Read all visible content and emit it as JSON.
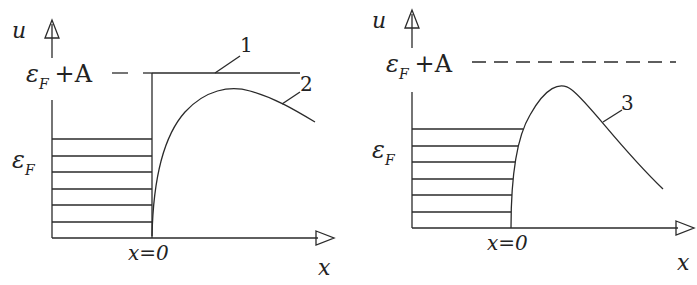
{
  "panels": [
    {
      "id": "left",
      "axis_y_label": "u",
      "axis_x_label": "x",
      "level_top_label": "ε",
      "level_top_sub": "F",
      "level_top_suffix": "+A",
      "fermi_label": "ε",
      "fermi_sub": "F",
      "origin_label": "x=0",
      "curve_labels": [
        "1",
        "2"
      ],
      "num_filled_levels": 6
    },
    {
      "id": "right",
      "axis_y_label": "u",
      "axis_x_label": "x",
      "level_top_label": "ε",
      "level_top_sub": "F",
      "level_top_suffix": "+A",
      "fermi_label": "ε",
      "fermi_sub": "F",
      "origin_label": "x=0",
      "curve_labels": [
        "3"
      ],
      "num_filled_levels": 6
    }
  ],
  "colors": {
    "line": "#2a2a2a",
    "background": "#ffffff"
  }
}
